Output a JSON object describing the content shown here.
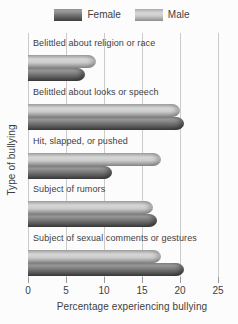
{
  "legend": {
    "items": [
      {
        "key": "female",
        "label": "Female"
      },
      {
        "key": "male",
        "label": "Male"
      }
    ]
  },
  "chart_data": {
    "type": "bar",
    "orientation": "horizontal",
    "title": "",
    "xlabel": "Percentage experiencing bullying",
    "ylabel": "Type of bullying",
    "categories": [
      "Belittled about religion or race",
      "Belittled about looks or speech",
      "Hit, slapped, or pushed",
      "Subject of rumors",
      "Subject of sexual comments or gestures"
    ],
    "series": [
      {
        "name": "Female",
        "key": "female",
        "values": [
          7.5,
          20.5,
          11,
          17,
          20.5
        ]
      },
      {
        "name": "Male",
        "key": "male",
        "values": [
          9,
          20,
          17.5,
          16.5,
          17.5
        ]
      }
    ],
    "row_order_top_to_bottom": [
      "male",
      "female"
    ],
    "xticks": [
      0,
      5,
      10,
      15,
      20,
      25
    ],
    "xlim": [
      0,
      25
    ],
    "grid": "vertical",
    "legend_position": "top"
  },
  "colors": {
    "female_gradient": [
      "#929292 0%",
      "#9d9d9d 18%",
      "#6e6e6e 55%",
      "#3f3f3f 100%"
    ],
    "male_gradient": [
      "#a9a9a9 0%",
      "#d7d7d7 32%",
      "#cccccc 58%",
      "#8c8c8c 100%"
    ],
    "gridline": "#cbcbcb",
    "tick": "#9a9a9a",
    "text": "#3e3e3e"
  }
}
